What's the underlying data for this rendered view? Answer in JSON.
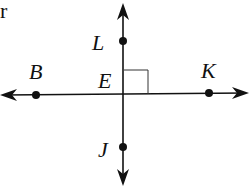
{
  "diagram": {
    "corner_text": "r",
    "lines": [
      {
        "name": "vertical-line",
        "through": [
          "L",
          "E",
          "J"
        ],
        "arrows": "both"
      },
      {
        "name": "horizontal-line",
        "through": [
          "B",
          "E",
          "K"
        ],
        "arrows": "both"
      }
    ],
    "points": [
      {
        "id": "L",
        "label": "L"
      },
      {
        "id": "B",
        "label": "B"
      },
      {
        "id": "E",
        "label": "E"
      },
      {
        "id": "K",
        "label": "K"
      },
      {
        "id": "J",
        "label": "J"
      }
    ],
    "right_angle_mark": {
      "at": "E",
      "quadrant": "upper-right"
    },
    "colors": {
      "ink": "#111111",
      "background": "#ffffff"
    }
  }
}
